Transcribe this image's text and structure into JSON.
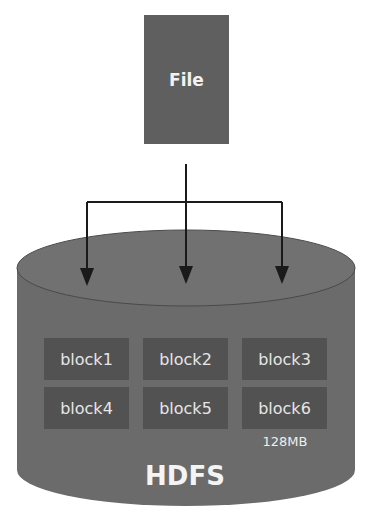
{
  "file": {
    "label": "File"
  },
  "storage": {
    "label": "HDFS",
    "block_size_label": "128MB",
    "blocks": [
      {
        "label": "block1"
      },
      {
        "label": "block2"
      },
      {
        "label": "block3"
      },
      {
        "label": "block4"
      },
      {
        "label": "block5"
      },
      {
        "label": "block6"
      }
    ]
  },
  "colors": {
    "file_fill": "#5f5f5f",
    "cylinder_fill": "#6b6b6b",
    "cylinder_top": "#707070",
    "block_fill": "#525252",
    "arrow": "#1a1a1a"
  }
}
